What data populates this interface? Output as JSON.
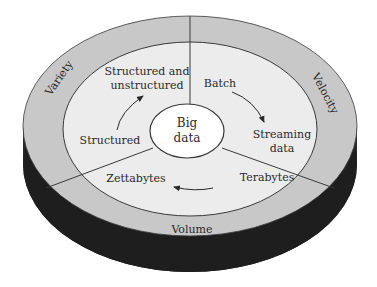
{
  "diagram": {
    "center": {
      "line1": "Big",
      "line2": "data"
    },
    "outer_ring": {
      "variety": "Variety",
      "velocity": "Velocity",
      "volume": "Volume"
    },
    "inner_ring": {
      "variety": {
        "from": "Structured",
        "to_line1": "Structured and",
        "to_line2": "unstructured"
      },
      "velocity": {
        "from": "Batch",
        "to_line1": "Streaming",
        "to_line2": "data"
      },
      "volume": {
        "from": "Terabytes",
        "to": "Zettabytes"
      }
    },
    "colors": {
      "outer_ring": "#c8c8c8",
      "inner_area": "#ececec",
      "center": "#ffffff",
      "side": "#1e1e1e",
      "stroke": "#3a3a3a"
    }
  }
}
